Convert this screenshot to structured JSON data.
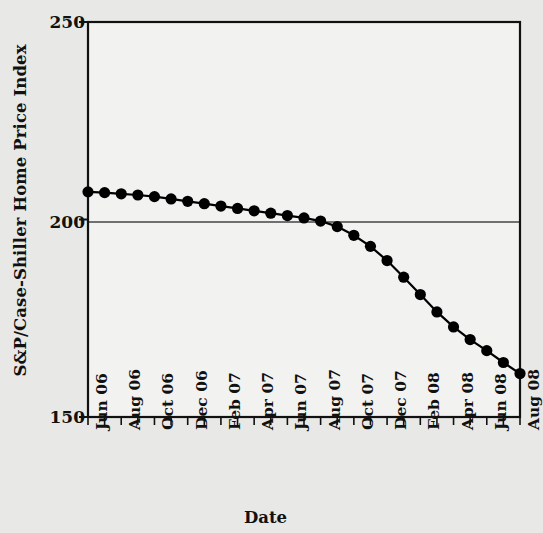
{
  "chart_data": {
    "type": "line",
    "title": "",
    "xlabel": "Date",
    "ylabel": "S&P/Case-Shiller Home Price Index",
    "ylim": [
      150,
      250
    ],
    "yticks": [
      150,
      200,
      250
    ],
    "ytick_labels": [
      "150",
      "200",
      "250"
    ],
    "grid": true,
    "gridlines_y": [
      200
    ],
    "legend": null,
    "marker": "filled-circle",
    "line_color": "#000000",
    "marker_color": "#000000",
    "plot_background": "#f2f2f0",
    "figure_background": "#e8e8e6",
    "x": [
      "Jun 06",
      "Jul 06",
      "Aug 06",
      "Sep 06",
      "Oct 06",
      "Nov 06",
      "Dec 06",
      "Jan 07",
      "Feb 07",
      "Mar 07",
      "Apr 07",
      "May 07",
      "Jun 07",
      "Jul 07",
      "Aug 07",
      "Sep 07",
      "Oct 07",
      "Nov 07",
      "Dec 07",
      "Jan 08",
      "Feb 08",
      "Mar 08",
      "Apr 08",
      "May 08",
      "Jun 08",
      "Jul 08",
      "Aug 08"
    ],
    "xtick_labels_shown": [
      "Jun 06",
      "Aug 06",
      "Oct 06",
      "Dec 06",
      "Feb 07",
      "Apr 07",
      "Jun 07",
      "Aug 07",
      "Oct 07",
      "Dec 07",
      "Feb 08",
      "Apr 08",
      "Jun 08",
      "Aug 08"
    ],
    "values": [
      207.0,
      206.8,
      206.5,
      206.2,
      205.8,
      205.2,
      204.6,
      204.0,
      203.4,
      202.8,
      202.2,
      201.6,
      201.0,
      200.4,
      199.6,
      198.2,
      196.0,
      193.2,
      189.6,
      185.4,
      181.0,
      176.6,
      172.8,
      169.6,
      166.8,
      163.8,
      161.0
    ],
    "x_count": 27,
    "y_unit_label": "index"
  }
}
